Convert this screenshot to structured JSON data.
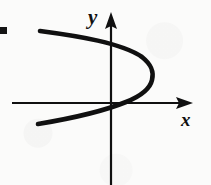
{
  "figure": {
    "kind": "coordinate-axes-diagram",
    "background_color": "#fbfbfa",
    "ink_color": "#101010",
    "canvas": {
      "width": 211,
      "height": 185
    }
  },
  "axes": {
    "origin": {
      "x": 110,
      "y": 103
    },
    "x_axis": {
      "label": "x",
      "start": {
        "x": 12,
        "y": 103
      },
      "end": {
        "x": 193,
        "y": 103
      },
      "has_arrowhead": true,
      "arrow_at": "right",
      "stroke_width": 2.2,
      "label_position": {
        "x": 181,
        "y": 110
      }
    },
    "y_axis": {
      "label": "y",
      "start": {
        "x": 111,
        "y": 185
      },
      "end": {
        "x": 111,
        "y": 12
      },
      "has_arrowhead": true,
      "arrow_at": "top",
      "stroke_width": 2.2,
      "label_position": {
        "x": 88,
        "y": 7
      }
    },
    "tick_labels": [],
    "gridlines": false
  },
  "curve": {
    "name": "sideways-parabola",
    "opens": "left",
    "stroke_width": 4.6,
    "vertex": {
      "x": 152,
      "y": 76
    },
    "upper_branch_endpoint": {
      "x": 40,
      "y": 31
    },
    "lower_branch_endpoint": {
      "x": 38,
      "y": 124
    },
    "y_axis_crossings": [
      {
        "x": 111,
        "y": 46
      },
      {
        "x": 111,
        "y": 104
      }
    ],
    "x_axis_crossing": {
      "x": 106,
      "y": 103
    },
    "path": "M 40 31 C 78 36, 122 43, 142 57 C 152 65, 154 72, 152 80 C 150 89, 141 96, 126 102 C 104 111, 68 119, 38 124"
  },
  "artifacts": [
    {
      "name": "scan-mark-left-edge",
      "x": 0,
      "y": 27,
      "width": 7,
      "height": 7,
      "color": "#141414"
    }
  ]
}
